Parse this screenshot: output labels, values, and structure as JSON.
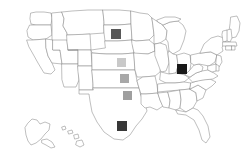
{
  "map": {
    "title": "United States choropleth marker map",
    "region_label": "United States",
    "projection_note": "Alaska and Hawaii inset at lower left",
    "background_color": "#ffffff",
    "state_fill_color": "#ffffff",
    "state_border_color": "#8a8a8a",
    "includes_insets": [
      "Alaska",
      "Hawaii"
    ]
  },
  "legend": {
    "visible": false,
    "scale_description": "Light gray to black square markers indicating increasing value"
  },
  "chart_data": {
    "type": "map",
    "title": "",
    "xlabel": "",
    "ylabel": "",
    "marker_shape": "square",
    "value_encoding": "grayscale darkness",
    "categories": [
      "North Dakota",
      "Nebraska",
      "Kansas",
      "Oklahoma",
      "Texas",
      "Ohio"
    ],
    "values": [
      6,
      2,
      3,
      4,
      8,
      9
    ],
    "colors": [
      "#585858",
      "#c9c9c9",
      "#a8a8a8",
      "#9f9f9f",
      "#383838",
      "#181818"
    ],
    "markers": [
      {
        "state": "North Dakota",
        "state_abbr": "ND",
        "color": "#585858",
        "value": 6,
        "x": 116,
        "y": 34,
        "size": 10
      },
      {
        "state": "Nebraska",
        "state_abbr": "NE",
        "color": "#c9c9c9",
        "value": 2,
        "x": 121.5,
        "y": 62,
        "size": 9
      },
      {
        "state": "Kansas",
        "state_abbr": "KS",
        "color": "#a8a8a8",
        "value": 3,
        "x": 124,
        "y": 78.5,
        "size": 9
      },
      {
        "state": "Oklahoma",
        "state_abbr": "OK",
        "color": "#9f9f9f",
        "value": 4,
        "x": 127,
        "y": 95,
        "size": 9
      },
      {
        "state": "Texas",
        "state_abbr": "TX",
        "color": "#383838",
        "value": 8,
        "x": 122,
        "y": 126,
        "size": 10
      },
      {
        "state": "Ohio",
        "state_abbr": "OH",
        "color": "#181818",
        "value": 9,
        "x": 182,
        "y": 69,
        "size": 10
      }
    ]
  }
}
